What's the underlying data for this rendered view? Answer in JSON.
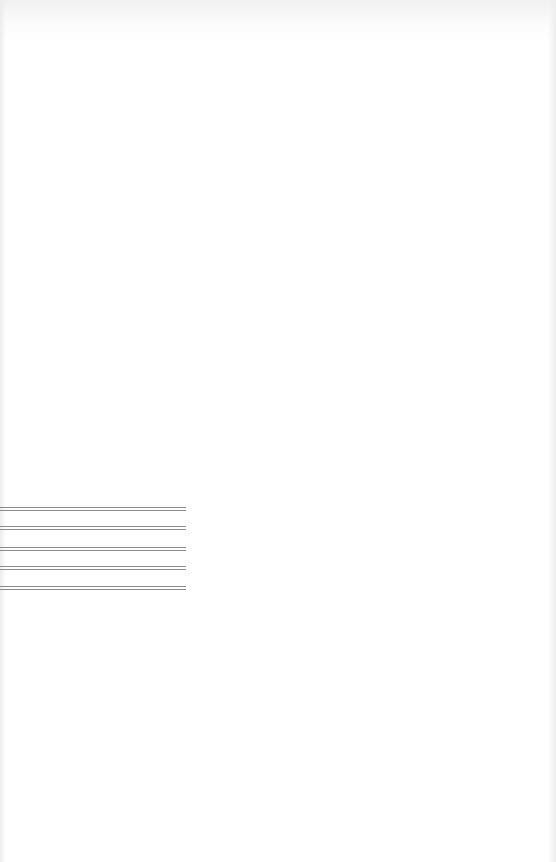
{
  "page": {
    "background": "#ffffff",
    "rules": [
      {
        "top": 507
      },
      {
        "top": 526
      },
      {
        "top": 547
      },
      {
        "top": 566
      },
      {
        "top": 586
      }
    ],
    "rule_color": "#8a8a8a"
  }
}
